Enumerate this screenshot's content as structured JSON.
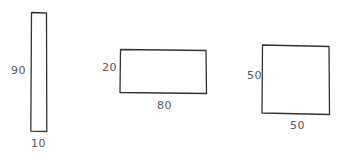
{
  "diagram": {
    "title": "",
    "stroke_color": "#333333",
    "text_color": "#555555",
    "shapes": [
      {
        "id": "rect-tall",
        "height_label": "90",
        "width_label": "10",
        "height": 90,
        "width": 10
      },
      {
        "id": "rect-wide",
        "height_label": "20",
        "width_label": "80",
        "height": 20,
        "width": 80
      },
      {
        "id": "rect-square",
        "height_label": "50",
        "width_label": "50",
        "height": 50,
        "width": 50
      }
    ]
  }
}
